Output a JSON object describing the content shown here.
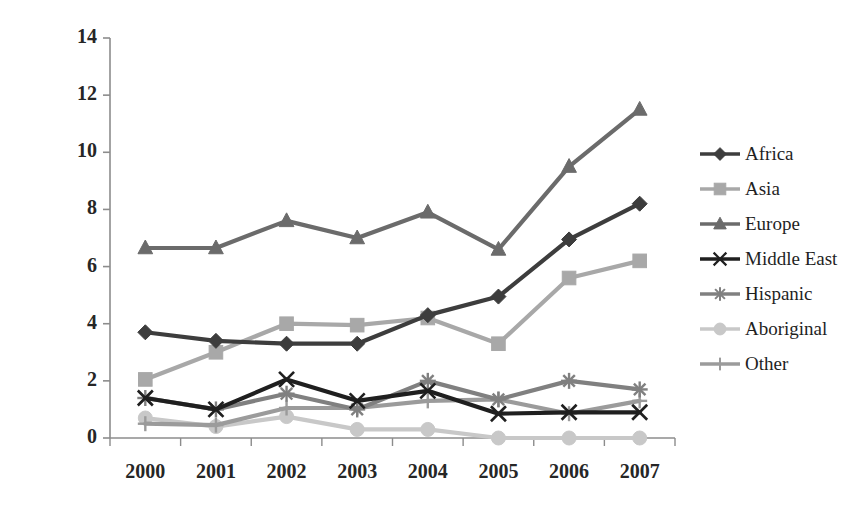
{
  "chart_data": {
    "type": "line",
    "title": "",
    "xlabel": "",
    "ylabel": "",
    "categories": [
      "2000",
      "2001",
      "2002",
      "2003",
      "2004",
      "2005",
      "2006",
      "2007"
    ],
    "x_tick_labels": [
      "2000",
      "2001",
      "2002",
      "2003",
      "2004",
      "2005",
      "2006",
      "2007"
    ],
    "y_tick_labels": [
      "0",
      "2",
      "4",
      "6",
      "8",
      "10",
      "12",
      "14"
    ],
    "y_ticks": [
      0,
      2,
      4,
      6,
      8,
      10,
      12,
      14
    ],
    "ylim": [
      0,
      14
    ],
    "grid": false,
    "legend_position": "right",
    "series": [
      {
        "name": "Africa",
        "marker": "diamond",
        "color": "#3d3d3d",
        "values": [
          3.7,
          3.4,
          3.3,
          3.3,
          4.3,
          4.95,
          6.95,
          8.2
        ]
      },
      {
        "name": "Asia",
        "marker": "square",
        "color": "#a8a8a8",
        "values": [
          2.05,
          3.0,
          4.0,
          3.95,
          4.2,
          3.3,
          5.6,
          6.2
        ]
      },
      {
        "name": "Europe",
        "marker": "triangle",
        "color": "#6b6b6b",
        "values": [
          6.65,
          6.65,
          7.6,
          7.0,
          7.9,
          6.6,
          9.5,
          11.5
        ]
      },
      {
        "name": "Middle East",
        "marker": "x-cross",
        "color": "#1f1f1f",
        "values": [
          1.4,
          1.0,
          2.05,
          1.3,
          1.65,
          0.85,
          0.9,
          0.9
        ]
      },
      {
        "name": "Hispanic",
        "marker": "asterisk",
        "color": "#808080",
        "values": [
          1.4,
          1.0,
          1.55,
          1.0,
          2.0,
          1.35,
          2.0,
          1.7
        ]
      },
      {
        "name": "Aboriginal",
        "marker": "circle",
        "color": "#c8c8c8",
        "values": [
          0.7,
          0.4,
          0.75,
          0.3,
          0.3,
          0.0,
          0.0,
          0.0
        ]
      },
      {
        "name": "Other",
        "marker": "plus",
        "color": "#9b9b9b",
        "values": [
          0.5,
          0.45,
          1.05,
          1.05,
          1.3,
          1.35,
          0.85,
          1.3
        ]
      }
    ]
  },
  "axes": {
    "axis_color": "#8c8c8c",
    "label_color": "#262626"
  },
  "legend": {
    "entries": [
      {
        "label": "Africa"
      },
      {
        "label": "Asia"
      },
      {
        "label": "Europe"
      },
      {
        "label": "Middle East"
      },
      {
        "label": "Hispanic"
      },
      {
        "label": "Aboriginal"
      },
      {
        "label": "Other"
      }
    ]
  }
}
